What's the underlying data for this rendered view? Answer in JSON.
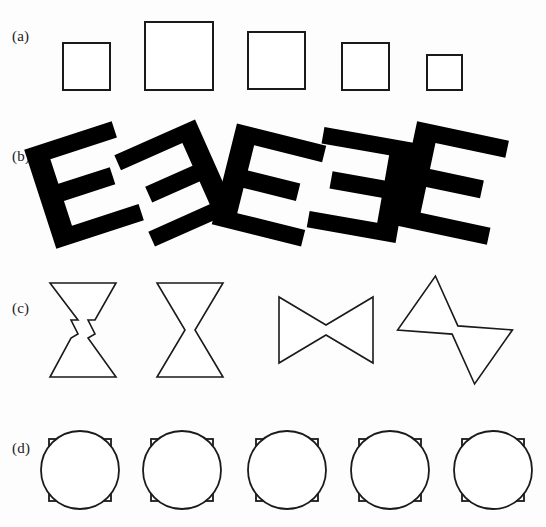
{
  "figure": {
    "width": 546,
    "height": 527,
    "background_color": "#fdfdfd",
    "stroke_color": "#1a1a1a",
    "fill_color": "#000000",
    "outline_fill": "#ffffff"
  },
  "rows": [
    {
      "id": "a",
      "label": "(a)",
      "label_x": 12,
      "label_y": 28,
      "shape_type": "square",
      "description": "five open squares of differing size aligned along a common baseline",
      "items": [
        {
          "name": "square-1",
          "x": 63,
          "y": 43,
          "size": 47,
          "stroke": 2.0
        },
        {
          "name": "square-2",
          "x": 145,
          "y": 22,
          "size": 68,
          "stroke": 2.0
        },
        {
          "name": "square-3",
          "x": 248,
          "y": 32,
          "size": 57,
          "stroke": 2.0
        },
        {
          "name": "square-4",
          "x": 342,
          "y": 43,
          "size": 47,
          "stroke": 2.0
        },
        {
          "name": "square-5",
          "x": 427,
          "y": 55,
          "size": 35,
          "stroke": 2.0
        }
      ]
    },
    {
      "id": "b",
      "label": "(b)",
      "label_x": 12,
      "label_y": 148,
      "shape_type": "letter-e",
      "description": "five solid block letter E glyphs, some mirrored, each at a different rotation",
      "items": [
        {
          "name": "letter-e-1",
          "cx": 84,
          "cy": 185,
          "scale": 1.0,
          "rotation": -18,
          "mirrored": false
        },
        {
          "name": "letter-e-2",
          "cx": 175,
          "cy": 183,
          "scale": 0.96,
          "rotation": -24,
          "mirrored": true
        },
        {
          "name": "letter-e-3",
          "cx": 269,
          "cy": 185,
          "scale": 1.0,
          "rotation": 14,
          "mirrored": false
        },
        {
          "name": "letter-e-4",
          "cx": 360,
          "cy": 185,
          "scale": 0.98,
          "rotation": 10,
          "mirrored": true
        },
        {
          "name": "letter-e-5",
          "cx": 452,
          "cy": 183,
          "scale": 1.02,
          "rotation": 12,
          "mirrored": false
        }
      ]
    },
    {
      "id": "c",
      "label": "(c)",
      "label_x": 12,
      "label_y": 300,
      "shape_type": "hourglass",
      "description": "four open hourglass / bowtie outlines, the first with a notched waist, the later ones rotated",
      "items": [
        {
          "name": "hourglass-1",
          "cx": 83,
          "cy": 330,
          "scale": 1.0,
          "rotation": 0,
          "notched": true
        },
        {
          "name": "hourglass-2",
          "cx": 190,
          "cy": 330,
          "scale": 1.0,
          "rotation": 0,
          "notched": false
        },
        {
          "name": "hourglass-3",
          "cx": 326,
          "cy": 330,
          "scale": 1.0,
          "rotation": 90,
          "notched": false
        },
        {
          "name": "hourglass-4",
          "cx": 455,
          "cy": 330,
          "scale": 1.0,
          "rotation": 125,
          "notched": false
        }
      ]
    },
    {
      "id": "d",
      "label": "(d)",
      "label_x": 12,
      "label_y": 440,
      "shape_type": "circle-over-square",
      "description": "five identical figures, each an open circle overlapping an open square of slightly smaller width",
      "items": [
        {
          "name": "circle-square-1",
          "cx": 80,
          "cy": 470,
          "r": 39,
          "square": 62
        },
        {
          "name": "circle-square-2",
          "cx": 182,
          "cy": 470,
          "r": 39,
          "square": 62
        },
        {
          "name": "circle-square-3",
          "cx": 287,
          "cy": 470,
          "r": 39,
          "square": 62
        },
        {
          "name": "circle-square-4",
          "cx": 390,
          "cy": 470,
          "r": 39,
          "square": 62
        },
        {
          "name": "circle-square-5",
          "cx": 493,
          "cy": 470,
          "r": 39,
          "square": 62
        }
      ]
    }
  ]
}
